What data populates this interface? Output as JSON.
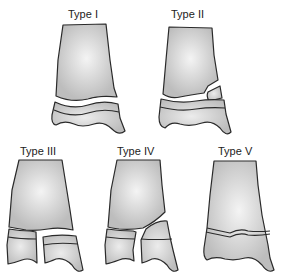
{
  "panels": [
    {
      "id": "type-1",
      "label": "Type I"
    },
    {
      "id": "type-2",
      "label": "Type II"
    },
    {
      "id": "type-3",
      "label": "Type III"
    },
    {
      "id": "type-4",
      "label": "Type IV"
    },
    {
      "id": "type-5",
      "label": "Type V"
    }
  ],
  "colors": {
    "bone_fill": "#c8c8c8",
    "bone_highlight": "#f2f2f2",
    "outline": "#2a2a2a",
    "background": "#ffffff"
  }
}
